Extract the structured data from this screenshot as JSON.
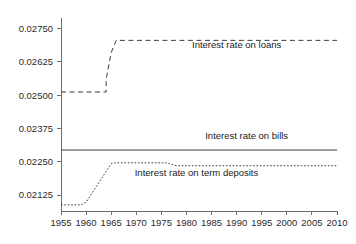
{
  "chart_data": {
    "type": "line",
    "title": "",
    "subtitle": "",
    "xlabel": "",
    "ylabel": "",
    "grid": false,
    "legend_position": "inline-annotation",
    "xlim": [
      1955,
      2010
    ],
    "ylim": [
      0.02065,
      0.0279
    ],
    "x_ticks": [
      1955,
      1960,
      1965,
      1970,
      1975,
      1980,
      1985,
      1990,
      1995,
      2000,
      2005,
      2010
    ],
    "x_tick_labels": [
      "1955",
      "1960",
      "1965",
      "1970",
      "1975",
      "1980",
      "1985",
      "1990",
      "1995",
      "2000",
      "2005",
      "2010"
    ],
    "y_ticks": [
      0.02125,
      0.0225,
      0.02375,
      0.025,
      0.02625,
      0.0275
    ],
    "y_tick_labels": [
      "0.02125",
      "0.02250",
      "0.02375",
      "0.02500",
      "0.02625",
      "0.02750"
    ],
    "series": [
      {
        "name": "Interest rate on loans",
        "style": "dashed",
        "label": "Interest rate on loans",
        "label_x": 1990,
        "label_y": 0.02676,
        "x": [
          1955,
          1964,
          1964,
          1965,
          1966,
          2010
        ],
        "values": [
          0.02512,
          0.02512,
          0.0256,
          0.0266,
          0.02706,
          0.02706
        ]
      },
      {
        "name": "Interest rate on bills",
        "style": "solid",
        "label": "Interest rate on bills",
        "label_x": 1992,
        "label_y": 0.02337,
        "x": [
          1955,
          2010
        ],
        "values": [
          0.02294,
          0.02294
        ]
      },
      {
        "name": "Interest rate on term deposits",
        "style": "dotted",
        "label": "Interest rate on term deposits",
        "label_x": 1982,
        "label_y": 0.02196,
        "x": [
          1955,
          1959,
          1960,
          1965,
          1966,
          1976,
          1978,
          2010
        ],
        "values": [
          0.02088,
          0.02088,
          0.02098,
          0.02243,
          0.02246,
          0.02246,
          0.02235,
          0.02235
        ]
      }
    ],
    "colors": {
      "axis": "#6e6e6e",
      "series": "#3a3a3a",
      "text": "#1a1a1a",
      "background": "#ffffff"
    }
  }
}
